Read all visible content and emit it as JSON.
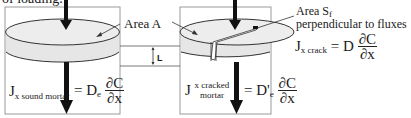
{
  "caption": "of loading.",
  "labels": {
    "area_a": "Area A",
    "area_sf_line1": "Area S",
    "area_sf_sub": "f",
    "area_sf_line2": "perpendicular to fluxes",
    "thickness": "L"
  },
  "equations": {
    "sound": {
      "lhs": "J",
      "lhs_sub": "x sound mortar",
      "equals": "=",
      "coef": "D",
      "coef_sub": "e",
      "num": "∂C",
      "den": "∂x"
    },
    "cracked": {
      "lhs": "J",
      "lhs_sub_line1": "x  cracked",
      "lhs_sub_line2": "mortar",
      "equals": "=",
      "coef": "D'",
      "coef_sub": "e",
      "num": "∂C",
      "den": "∂x"
    },
    "crack": {
      "lhs": "J",
      "lhs_sub": "x crack",
      "equals": "=",
      "coef": "D",
      "num": "∂C",
      "den": "∂x"
    }
  },
  "colors": {
    "disc_fill": "#ececec",
    "outline": "#333333",
    "box_border": "#9a9a9a",
    "arrow": "#111111"
  }
}
